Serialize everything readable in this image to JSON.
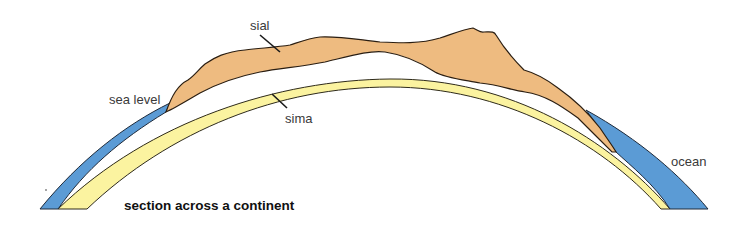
{
  "diagram": {
    "title": "section across a continent",
    "labels": {
      "sial": "sial",
      "sima": "sima",
      "sea_level": "sea level",
      "ocean": "ocean"
    },
    "layers": [
      {
        "name": "ocean",
        "color": "#5b9bd5"
      },
      {
        "name": "sial",
        "color": "#eebb80"
      },
      {
        "name": "sima",
        "color": "#fbf3a0"
      }
    ]
  }
}
